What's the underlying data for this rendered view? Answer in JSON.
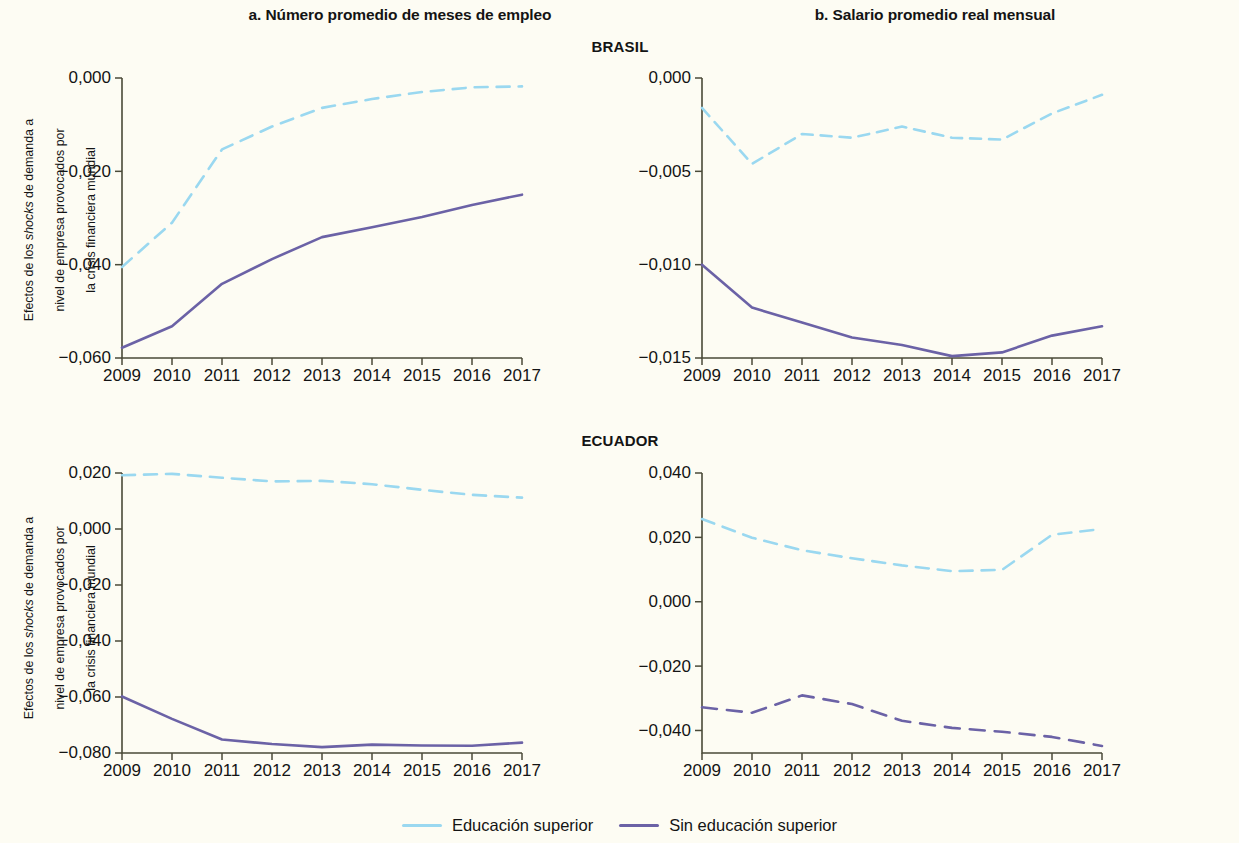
{
  "figure": {
    "column_titles": {
      "a": "a. Número promedio de meses de empleo",
      "b": "b. Salario promedio real mensual"
    },
    "country_titles": {
      "brasil": "BRASIL",
      "ecuador": "ECUADOR"
    },
    "y_axis_label_line1": "Efectos de los shocks de demanda a",
    "y_axis_label_line2": "nivel de empresa provocados por",
    "y_axis_label_line3": "la crisis financiera mundial",
    "y_axis_label": "Efectos de los shocks de demanda a nivel de empresa provocados por la crisis financiera mundial"
  },
  "legend": {
    "position": "bottom-center",
    "entries": [
      {
        "label": "Educación superior",
        "color": "#9ad8f0"
      },
      {
        "label": "Sin educación superior",
        "color": "#6b62a6"
      }
    ]
  },
  "colors": {
    "higher_education": "#9ad8f0",
    "no_higher_education": "#6b62a6",
    "background": "#fdfcf3",
    "axis": "#4a4a38",
    "text": "#141414"
  },
  "chart_data": [
    {
      "id": "brasil-empleo",
      "type": "line",
      "title": "a. Número promedio de meses de empleo",
      "panel": "a",
      "country": "BRASIL",
      "xlabel": "",
      "ylabel": "Efectos de los shocks de demanda a nivel de empresa provocados por la crisis financiera mundial",
      "x": [
        2009,
        2010,
        2011,
        2012,
        2013,
        2014,
        2015,
        2016,
        2017
      ],
      "xticklabels": [
        "2009",
        "2010",
        "2011",
        "2012",
        "2013",
        "2014",
        "2015",
        "2016",
        "2017"
      ],
      "yticks": [
        0.0,
        -0.02,
        -0.04,
        -0.06
      ],
      "yticklabels": [
        "0,000",
        "−0,020",
        "−0,040",
        "−0,060"
      ],
      "ylim": [
        -0.06,
        0.0
      ],
      "grid": false,
      "series": [
        {
          "name": "Educación superior",
          "color": "#9ad8f0",
          "style": "solid-dashed",
          "values": [
            -0.0405,
            -0.031,
            -0.0153,
            -0.0104,
            -0.0064,
            -0.0045,
            -0.003,
            -0.002,
            -0.0018
          ]
        },
        {
          "name": "Sin educación superior",
          "color": "#6b62a6",
          "style": "solid",
          "values": [
            -0.0578,
            -0.0532,
            -0.0441,
            -0.0388,
            -0.0341,
            -0.032,
            -0.0298,
            -0.0272,
            -0.025
          ]
        }
      ]
    },
    {
      "id": "brasil-salario",
      "type": "line",
      "title": "b. Salario promedio real mensual",
      "panel": "b",
      "country": "BRASIL",
      "xlabel": "",
      "ylabel": "",
      "x": [
        2009,
        2010,
        2011,
        2012,
        2013,
        2014,
        2015,
        2016,
        2017
      ],
      "xticklabels": [
        "2009",
        "2010",
        "2011",
        "2012",
        "2013",
        "2014",
        "2015",
        "2016",
        "2017"
      ],
      "yticks": [
        0.0,
        -0.005,
        -0.01,
        -0.015
      ],
      "yticklabels": [
        "0,000",
        "−0,005",
        "−0,010",
        "−0,015"
      ],
      "ylim": [
        -0.015,
        0.0
      ],
      "grid": false,
      "series": [
        {
          "name": "Educación superior",
          "color": "#9ad8f0",
          "style": "dashed",
          "values": [
            -0.0016,
            -0.0046,
            -0.003,
            -0.0032,
            -0.0026,
            -0.0032,
            -0.0033,
            -0.0019,
            -0.0009
          ]
        },
        {
          "name": "Sin educación superior",
          "color": "#6b62a6",
          "style": "solid",
          "values": [
            -0.01,
            -0.0123,
            -0.0131,
            -0.0139,
            -0.0143,
            -0.0149,
            -0.0147,
            -0.0138,
            -0.0133
          ]
        }
      ]
    },
    {
      "id": "ecuador-empleo",
      "type": "line",
      "title": "a. Número promedio de meses de empleo",
      "panel": "a",
      "country": "ECUADOR",
      "xlabel": "",
      "ylabel": "Efectos de los shocks de demanda a nivel de empresa provocados por la crisis financiera mundial",
      "x": [
        2009,
        2010,
        2011,
        2012,
        2013,
        2014,
        2015,
        2016,
        2017
      ],
      "xticklabels": [
        "2009",
        "2010",
        "2011",
        "2012",
        "2013",
        "2014",
        "2015",
        "2016",
        "2017"
      ],
      "yticks": [
        0.02,
        0.0,
        -0.02,
        -0.04,
        -0.06,
        -0.08
      ],
      "yticklabels": [
        "0,020",
        "0,000",
        "−0,020",
        "−0,040",
        "−0,060",
        "−0,080"
      ],
      "ylim": [
        -0.08,
        0.02
      ],
      "grid": false,
      "series": [
        {
          "name": "Educación superior",
          "color": "#9ad8f0",
          "style": "dashed",
          "values": [
            0.0192,
            0.0197,
            0.0183,
            0.017,
            0.0172,
            0.016,
            0.014,
            0.0122,
            0.0112
          ]
        },
        {
          "name": "Sin educación superior",
          "color": "#6b62a6",
          "style": "solid",
          "values": [
            -0.0598,
            -0.0678,
            -0.0752,
            -0.0768,
            -0.0779,
            -0.077,
            -0.0773,
            -0.0774,
            -0.0763
          ]
        }
      ]
    },
    {
      "id": "ecuador-salario",
      "type": "line",
      "title": "b. Salario promedio real mensual",
      "panel": "b",
      "country": "ECUADOR",
      "xlabel": "",
      "ylabel": "",
      "x": [
        2009,
        2010,
        2011,
        2012,
        2013,
        2014,
        2015,
        2016,
        2017
      ],
      "xticklabels": [
        "2009",
        "2010",
        "2011",
        "2012",
        "2013",
        "2014",
        "2015",
        "2016",
        "2017"
      ],
      "yticks": [
        0.04,
        0.02,
        0.0,
        -0.02,
        -0.04
      ],
      "yticklabels": [
        "0,040",
        "0,020",
        "0,000",
        "−0,020",
        "−0,040"
      ],
      "ylim": [
        -0.047,
        0.04
      ],
      "grid": false,
      "series": [
        {
          "name": "Educación superior",
          "color": "#9ad8f0",
          "style": "dashed",
          "values": [
            0.0257,
            0.0199,
            0.016,
            0.0135,
            0.0113,
            0.0095,
            0.0099,
            0.0208,
            0.0226
          ]
        },
        {
          "name": "Sin educación superior",
          "color": "#6b62a6",
          "style": "dashed",
          "values": [
            -0.0328,
            -0.0345,
            -0.0291,
            -0.0318,
            -0.037,
            -0.0392,
            -0.0404,
            -0.042,
            -0.0448
          ]
        }
      ]
    }
  ]
}
